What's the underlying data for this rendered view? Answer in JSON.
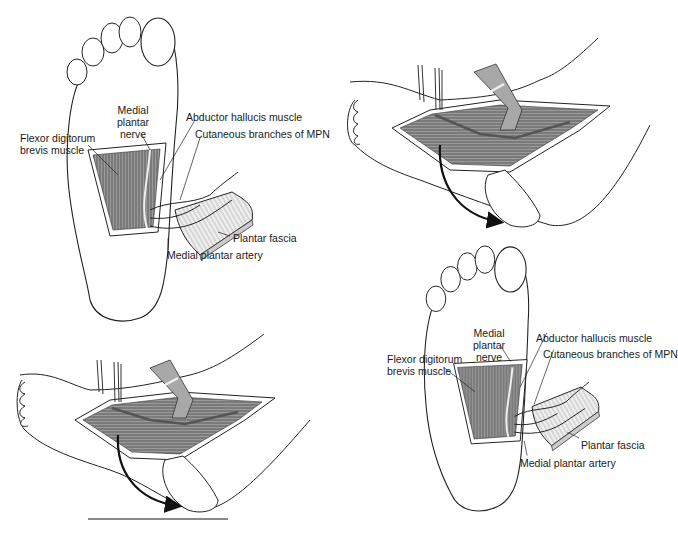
{
  "figure": {
    "type": "anatomical-illustration",
    "panels": [
      {
        "id": "top-left",
        "view": "plantar sole with exposed flexor digitorum brevis and reflected plantar fascia",
        "labels": {
          "medial_plantar_nerve_1": "Medial",
          "medial_plantar_nerve_2": "plantar",
          "medial_plantar_nerve_3": "nerve",
          "fdb_1": "Flexor digitorum",
          "fdb_2": "brevis muscle",
          "abductor_hallucis": "Abductor hallucis muscle",
          "cutaneous_branches": "Cutaneous branches of MPN",
          "plantar_fascia": "Plantar fascia",
          "medial_plantar_artery": "Medial plantar artery"
        }
      },
      {
        "id": "top-right",
        "view": "medial foot dissection with retractors and curved arrow indicating flap rotation",
        "labels": {}
      },
      {
        "id": "bottom-left",
        "view": "medial foot dissection with retractors and curved arrow indicating flap rotation",
        "labels": {}
      },
      {
        "id": "bottom-right",
        "view": "plantar sole with exposed flexor digitorum brevis and reflected plantar fascia",
        "labels": {
          "medial_plantar_nerve_1": "Medial",
          "medial_plantar_nerve_2": "plantar",
          "medial_plantar_nerve_3": "nerve",
          "fdb_1": "Flexor digitorum",
          "fdb_2": "brevis muscle",
          "abductor_hallucis": "Abductor hallucis muscle",
          "cutaneous_branches": "Cutaneous branches of MPN",
          "plantar_fascia": "Plantar fascia",
          "medial_plantar_artery": "Medial plantar artery"
        }
      }
    ],
    "colors": {
      "line": "#1a1a1a",
      "muscle_fill": "#8c8c8c",
      "fascia_fill": "#e6e6e6",
      "retractor_fill": "#a8a8a8",
      "rule": "#8a8a8a"
    }
  }
}
